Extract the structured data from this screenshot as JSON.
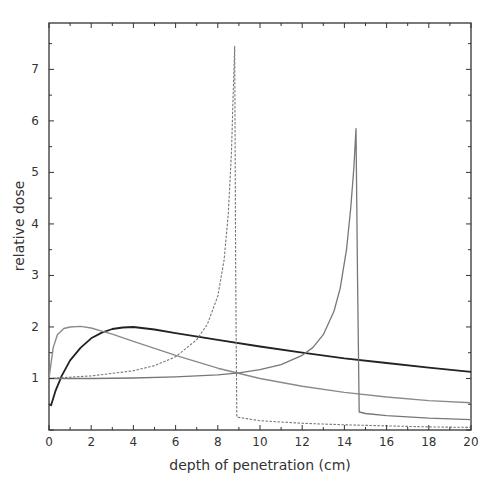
{
  "chart_data": {
    "type": "line",
    "title": "",
    "xlabel": "depth of penetration (cm)",
    "ylabel": "relative dose",
    "xlim": [
      0,
      20
    ],
    "ylim": [
      0,
      7.9
    ],
    "xticks": [
      0,
      2,
      4,
      6,
      8,
      10,
      12,
      14,
      16,
      18,
      20
    ],
    "yticks": [
      1,
      2,
      3,
      4,
      5,
      6,
      7
    ],
    "grid": false,
    "legend": null,
    "series": [
      {
        "name": "photon beam (black solid)",
        "style": "solid",
        "color": "#222222",
        "width": 1.8,
        "x": [
          0,
          0.1,
          0.3,
          0.6,
          1.0,
          1.5,
          2.0,
          2.5,
          3.0,
          3.5,
          4.0,
          5.0,
          6.0,
          8.0,
          10.0,
          12.0,
          14.0,
          16.0,
          18.0,
          20.0
        ],
        "y": [
          0.5,
          0.48,
          0.75,
          1.05,
          1.35,
          1.6,
          1.78,
          1.89,
          1.96,
          1.99,
          2.0,
          1.95,
          1.88,
          1.75,
          1.62,
          1.5,
          1.39,
          1.3,
          1.21,
          1.13
        ]
      },
      {
        "name": "gray build-up curve (gray solid)",
        "style": "solid",
        "color": "#8a8a8a",
        "width": 1.4,
        "x": [
          0,
          0.1,
          0.2,
          0.4,
          0.7,
          1.0,
          1.5,
          2.0,
          2.5,
          3.0,
          4.0,
          6.0,
          8.0,
          10.0,
          12.0,
          14.0,
          16.0,
          18.0,
          20.0
        ],
        "y": [
          1.0,
          1.3,
          1.6,
          1.85,
          1.97,
          2.0,
          2.01,
          1.98,
          1.92,
          1.86,
          1.72,
          1.45,
          1.2,
          1.0,
          0.85,
          0.73,
          0.64,
          0.57,
          0.53
        ]
      },
      {
        "name": "Bragg peak at 8.8 cm (dashed)",
        "style": "dashed",
        "color": "#777777",
        "width": 1.1,
        "x": [
          0,
          2,
          4,
          5,
          6,
          7,
          7.5,
          8.0,
          8.3,
          8.5,
          8.65,
          8.75,
          8.8,
          8.85,
          8.9,
          10,
          12,
          14,
          16,
          18,
          20
        ],
        "y": [
          1.0,
          1.05,
          1.15,
          1.25,
          1.42,
          1.75,
          2.05,
          2.6,
          3.3,
          4.2,
          5.4,
          6.8,
          7.45,
          3.0,
          0.25,
          0.18,
          0.13,
          0.1,
          0.08,
          0.06,
          0.05
        ]
      },
      {
        "name": "Bragg peak at 14.6 cm (gray solid)",
        "style": "solid",
        "color": "#777777",
        "width": 1.3,
        "x": [
          0,
          2,
          4,
          6,
          8,
          9,
          10,
          11,
          12,
          12.5,
          13,
          13.5,
          13.8,
          14.1,
          14.3,
          14.45,
          14.55,
          14.62,
          14.7,
          15,
          16,
          18,
          20
        ],
        "y": [
          1.0,
          1.0,
          1.01,
          1.03,
          1.07,
          1.11,
          1.17,
          1.27,
          1.45,
          1.6,
          1.85,
          2.3,
          2.75,
          3.5,
          4.3,
          5.1,
          5.85,
          3.0,
          0.35,
          0.32,
          0.28,
          0.23,
          0.2
        ]
      }
    ],
    "annotations": []
  }
}
